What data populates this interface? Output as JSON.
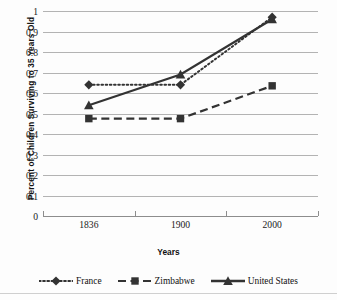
{
  "chart_data": {
    "type": "line",
    "title": "",
    "xlabel": "Years",
    "ylabel": "Percent of Children Surviving to 35 Years Old",
    "categories": [
      "1836",
      "1900",
      "2000"
    ],
    "ylim": [
      0,
      1
    ],
    "ytick_labels": [
      "0",
      "0.1",
      "0.2",
      "0.3",
      "0.4",
      "0.5",
      "0.6",
      "0.7",
      "0.8",
      "0.9",
      "1"
    ],
    "ytick_values": [
      0,
      0.1,
      0.2,
      0.3,
      0.4,
      0.5,
      0.6,
      0.7,
      0.8,
      0.9,
      1
    ],
    "grid": true,
    "legend_position": "bottom",
    "series": [
      {
        "name": "France",
        "values": [
          0.64,
          0.64,
          0.97
        ],
        "marker": "diamond",
        "line_style": "dotted",
        "color": "#333333"
      },
      {
        "name": "Zimbabwe",
        "values": [
          0.475,
          0.475,
          0.635
        ],
        "marker": "square",
        "line_style": "dashed",
        "color": "#333333"
      },
      {
        "name": "United States",
        "values": [
          0.54,
          0.69,
          0.96
        ],
        "marker": "triangle",
        "line_style": "solid",
        "color": "#333333"
      }
    ]
  },
  "legend": {
    "items": [
      {
        "label": "France",
        "marker": "diamond-marker",
        "line_style": "dotted"
      },
      {
        "label": "Zimbabwe",
        "marker": "square-marker",
        "line_style": "dashed"
      },
      {
        "label": "United States",
        "marker": "triangle-marker",
        "line_style": "solid"
      }
    ]
  },
  "colors": {
    "series": "#333333",
    "gridline": "#b3b3b3",
    "axis": "#8d8d8d",
    "text": "#111111",
    "background": "#fdfdfd"
  }
}
